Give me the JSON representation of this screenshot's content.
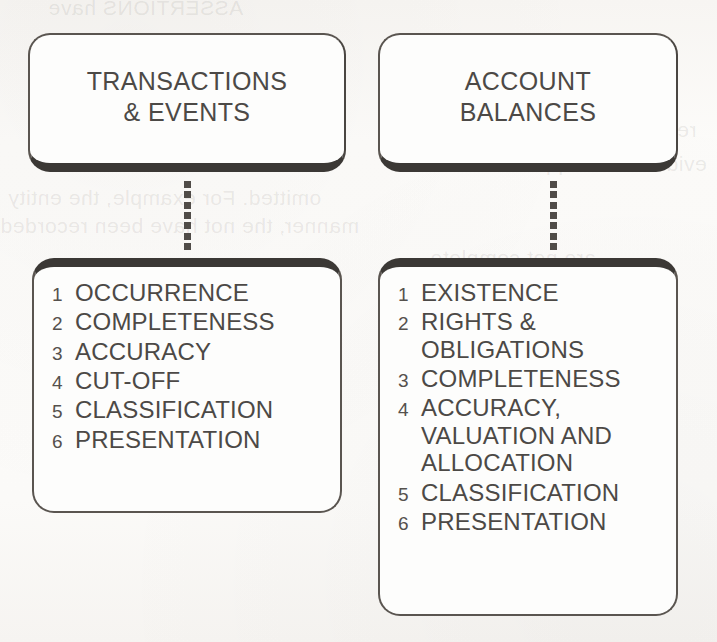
{
  "page": {
    "background_color": "#fbfaf8",
    "ink_color": "#4c4946",
    "shadow_color": "#3b3835",
    "bleed_through_lines": [
      "ASSERTIONS have",
      "reported. In other words, these",
      "evidence to support assertions",
      "omitted. For example, the entity",
      "manner, the not have been recorded",
      "are not complete"
    ]
  },
  "diagram": {
    "type": "two-column-node-diagram",
    "columns": [
      {
        "id": "transactions-and-events",
        "header": {
          "label": "TRANSACTIONS\n& EVENTS"
        },
        "connector": {
          "style": "dotted",
          "dot_count": 7
        },
        "assertions": [
          {
            "number": "1",
            "label": "OCCURRENCE"
          },
          {
            "number": "2",
            "label": "COMPLETENESS"
          },
          {
            "number": "3",
            "label": "ACCURACY"
          },
          {
            "number": "4",
            "label": "CUT-OFF"
          },
          {
            "number": "5",
            "label": "CLASSIFICATION"
          },
          {
            "number": "6",
            "label": "PRESENTATION"
          }
        ]
      },
      {
        "id": "account-balances",
        "header": {
          "label": "ACCOUNT\nBALANCES"
        },
        "connector": {
          "style": "dotted",
          "dot_count": 7
        },
        "assertions": [
          {
            "number": "1",
            "label": "EXISTENCE"
          },
          {
            "number": "2",
            "label": "RIGHTS &\nOBLIGATIONS"
          },
          {
            "number": "3",
            "label": "COMPLETENESS"
          },
          {
            "number": "4",
            "label": "ACCURACY,\nVALUATION AND\nALLOCATION"
          },
          {
            "number": "5",
            "label": "CLASSIFICATION"
          },
          {
            "number": "6",
            "label": "PRESENTATION"
          }
        ]
      }
    ]
  }
}
